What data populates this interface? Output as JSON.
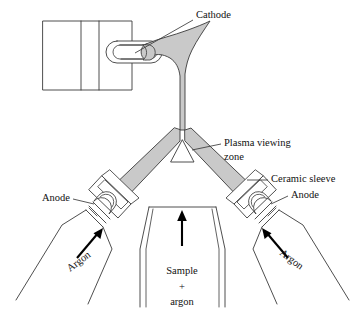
{
  "figure": {
    "kind": "technical-line-diagram",
    "background_color": "#ffffff",
    "line_color": "#3a3a3a",
    "plasma_fill_color": "#c9c9c9",
    "text_color": "#111111"
  },
  "labels": {
    "cathode": "Cathode",
    "plasma_zone_line1": "Plasma viewing",
    "plasma_zone_line2": "zone",
    "ceramic_sleeve": "Ceramic sleeve",
    "anode_left": "Anode",
    "anode_right": "Anode",
    "argon_left": "Argon",
    "argon_right": "Argon",
    "sample_line1": "Sample",
    "sample_line2": "+",
    "sample_line3": "argon"
  },
  "parts": [
    {
      "name": "cathode-block",
      "label": "Cathode",
      "description": "rectangular cathode housing with two vertical dividers"
    },
    {
      "name": "cathode-capsule",
      "label": "Cathode",
      "description": "rounded capsule electrode holder with grey tip"
    },
    {
      "name": "plasma-flare",
      "label": "",
      "description": "grey trumpet-shaped plasma plume rising from cathode"
    },
    {
      "name": "plasma-viewing-zone",
      "label": "Plasma viewing zone",
      "description": "small triangular observation region at the plasma apex"
    },
    {
      "name": "ceramic-sleeve-left",
      "label": "Ceramic sleeve",
      "description": "angled ceramic sleeve on left electrode arm"
    },
    {
      "name": "ceramic-sleeve-right",
      "label": "Ceramic sleeve",
      "description": "angled ceramic sleeve on right electrode arm"
    },
    {
      "name": "anode-left",
      "label": "Anode",
      "description": "left graphite anode inside sleeve"
    },
    {
      "name": "anode-right",
      "label": "Anode",
      "description": "right graphite anode inside sleeve"
    },
    {
      "name": "argon-inlet-left",
      "label": "Argon",
      "description": "left argon gas funnel inlet with upward flow arrow"
    },
    {
      "name": "argon-inlet-right",
      "label": "Argon",
      "description": "right argon gas funnel inlet with upward flow arrow"
    },
    {
      "name": "sample-tube",
      "label": "Sample + argon",
      "description": "central nebulised sample plus argon carrier tube with upward flow arrow"
    }
  ]
}
